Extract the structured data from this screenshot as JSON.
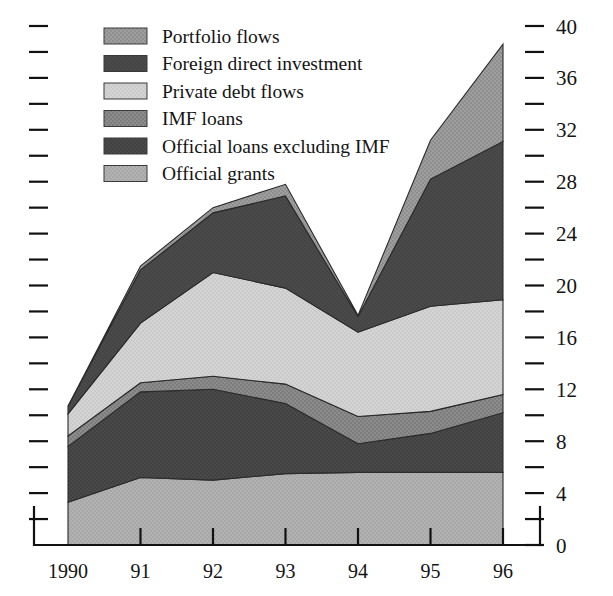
{
  "chart_data": {
    "type": "area",
    "stacked": true,
    "title": "",
    "subtitle": "",
    "xlabel": "",
    "ylabel": "",
    "grid": false,
    "legend_position": "top-left",
    "categories": [
      "1990",
      "91",
      "92",
      "93",
      "94",
      "95",
      "96"
    ],
    "x_tick_labels": [
      "1990",
      "91",
      "92",
      "93",
      "94",
      "95",
      "96"
    ],
    "ylim": [
      0,
      40
    ],
    "y_tick_labels": [
      "0",
      "4",
      "8",
      "12",
      "16",
      "20",
      "24",
      "28",
      "32",
      "36",
      "40"
    ],
    "y_major_step": 4,
    "y_minor_step": 2,
    "right_axis_labeled": true,
    "left_axis_labeled": false,
    "stack_order_bottom_to_top": [
      "Official grants",
      "Official loans excluding IMF",
      "IMF loans",
      "Private debt flows",
      "Foreign direct investment",
      "Portfolio flows"
    ],
    "series": [
      {
        "name": "Official grants",
        "color": "#b0b0b0",
        "values": [
          3.3,
          5.2,
          5.0,
          5.5,
          5.6,
          5.6,
          5.6
        ]
      },
      {
        "name": "Official loans excluding IMF",
        "color": "#4a4a4a",
        "values": [
          4.3,
          6.6,
          7.0,
          5.4,
          2.2,
          3.0,
          4.6
        ]
      },
      {
        "name": "IMF loans",
        "color": "#8c8c8c",
        "values": [
          0.8,
          0.7,
          1.0,
          1.5,
          2.1,
          1.7,
          1.4
        ]
      },
      {
        "name": "Private debt flows",
        "color": "#d2d2d2",
        "values": [
          1.7,
          4.6,
          8.0,
          7.4,
          6.5,
          8.1,
          7.3
        ]
      },
      {
        "name": "Foreign direct investment",
        "color": "#4a4a4a",
        "values": [
          0.6,
          4.1,
          4.6,
          7.1,
          1.2,
          9.8,
          12.2
        ]
      },
      {
        "name": "Portfolio flows",
        "color": "#9e9e9e",
        "values": [
          0.0,
          0.3,
          0.4,
          0.9,
          0.1,
          3.0,
          7.5
        ]
      }
    ],
    "totals": [
      10.7,
      21.5,
      26.0,
      27.8,
      17.7,
      31.2,
      38.6
    ]
  },
  "legend": {
    "items": [
      {
        "label": "Portfolio flows",
        "swatch": "portfolio-flows-swatch",
        "color": "#9e9e9e"
      },
      {
        "label": "Foreign direct investment",
        "swatch": "foreign-direct-investment-swatch",
        "color": "#4a4a4a"
      },
      {
        "label": "Private debt flows",
        "swatch": "private-debt-flows-swatch",
        "color": "#d2d2d2"
      },
      {
        "label": "IMF loans",
        "swatch": "imf-loans-swatch",
        "color": "#8c8c8c"
      },
      {
        "label": "Official loans excluding IMF",
        "swatch": "official-loans-excluding-imf-swatch",
        "color": "#4a4a4a"
      },
      {
        "label": "Official grants",
        "swatch": "official-grants-swatch",
        "color": "#b0b0b0"
      }
    ]
  },
  "axes": {
    "right_ticks": [
      "40",
      "36",
      "32",
      "28",
      "24",
      "20",
      "16",
      "12",
      "8",
      "4",
      "0"
    ],
    "x_ticks": [
      "1990",
      "91",
      "92",
      "93",
      "94",
      "95",
      "96"
    ]
  },
  "colors": {
    "axis": "#111111",
    "text": "#141414",
    "background": "#ffffff"
  }
}
